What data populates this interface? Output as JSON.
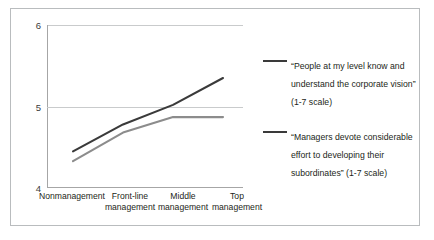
{
  "chart_data": {
    "type": "line",
    "title": "",
    "xlabel": "",
    "ylabel": "",
    "ylim": [
      4,
      6
    ],
    "yticks": [
      4,
      5,
      6
    ],
    "ytick_labels": [
      "4",
      "5",
      "6"
    ],
    "grid": "horizontal-at-5",
    "legend_position": "right",
    "categories": [
      "Nonmanagement",
      "Front-line\nmanagement",
      "Middle\nmanagement",
      "Top\nmanagement"
    ],
    "series": [
      {
        "name": "“People at my level know and understand the corporate vision” (1-7 scale)",
        "color": "#3a3a3a",
        "values": [
          4.45,
          4.78,
          5.02,
          5.35
        ]
      },
      {
        "name": "“Managers devote considerable effort to developing their subordinates” (1-7 scale)",
        "color": "#8c8c8c",
        "values": [
          4.33,
          4.68,
          4.87,
          4.87
        ]
      }
    ]
  },
  "legend": {
    "entries": [
      {
        "label": "“People at my level know and understand the corporate vision” (1-7 scale)",
        "color": "#3a3a3a"
      },
      {
        "label": "“Managers devote considerable effort to developing their subordinates” (1-7 scale)",
        "color": "#3a3a3a"
      }
    ]
  },
  "colors": {
    "series_primary": "#3a3a3a",
    "series_secondary": "#8c8c8c",
    "axis": "#a6a6a6",
    "grid": "#c9cbcc",
    "border": "#b9bcbe",
    "background": "#ffffff"
  }
}
